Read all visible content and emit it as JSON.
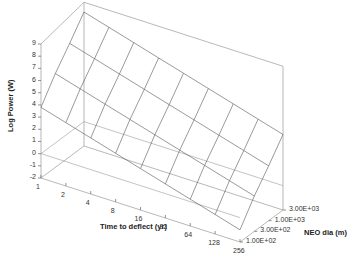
{
  "chart_data": {
    "type": "surface3d",
    "title": "",
    "xlabel": "Time to deflect (yr)",
    "ylabel": "NEO dia (m)",
    "zlabel": "Log Power (W)",
    "x_ticks": [
      "1",
      "2",
      "4",
      "8",
      "16",
      "32",
      "64",
      "128",
      "256"
    ],
    "y_ticks": [
      "1.00E+02",
      "3.00E+02",
      "1.00E+03",
      "3.00E+03"
    ],
    "z_ticks": [
      "9",
      "8",
      "7",
      "6",
      "5",
      "4",
      "3",
      "2",
      "1",
      "0",
      "-1",
      "-2"
    ],
    "zlim": [
      -2,
      9
    ],
    "grid": false,
    "x": [
      1,
      2,
      4,
      8,
      16,
      32,
      64,
      128,
      256
    ],
    "y": [
      100,
      300,
      1000,
      3000
    ],
    "series": [
      {
        "name": "NEO dia 1.00E+02",
        "values": [
          3.8,
          3.2,
          2.6,
          2.0,
          1.4,
          0.8,
          0.2,
          -0.4,
          -1.0
        ]
      },
      {
        "name": "NEO dia 3.00E+02",
        "values": [
          5.7,
          5.1,
          4.5,
          3.9,
          3.3,
          2.7,
          2.1,
          1.5,
          0.9
        ]
      },
      {
        "name": "NEO dia 1.00E+03",
        "values": [
          7.3,
          6.7,
          6.1,
          5.5,
          4.9,
          4.3,
          3.7,
          3.1,
          2.5
        ]
      },
      {
        "name": "NEO dia 3.00E+03",
        "values": [
          9.0,
          8.4,
          7.8,
          7.2,
          6.6,
          6.0,
          5.4,
          4.8,
          4.2
        ]
      }
    ]
  },
  "labels": {
    "zlabel": "Log Power (W)",
    "xlabel": "Time to deflect (yr)",
    "ylabel": "NEO dia (m)"
  }
}
